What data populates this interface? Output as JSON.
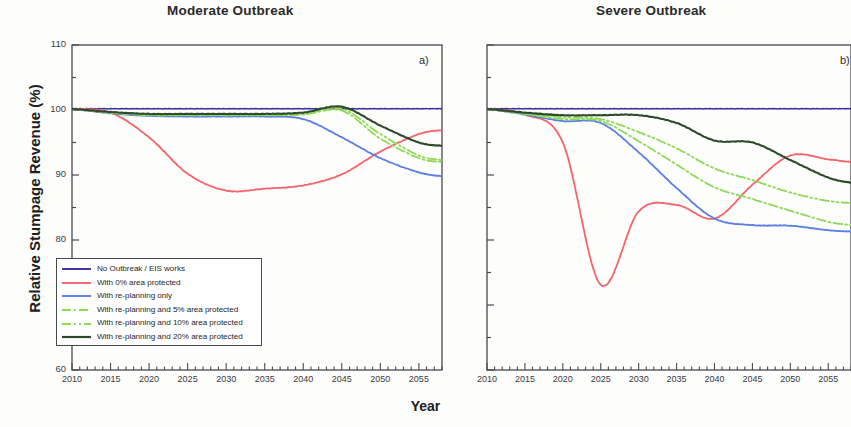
{
  "figure": {
    "ylabel": "Relative Stumpage Revenue (%)",
    "xlabel": "Year",
    "panel_a_letter": "a)",
    "panel_b_letter": "b)"
  },
  "panels": [
    {
      "key": "moderate",
      "title": "Moderate Outbreak"
    },
    {
      "key": "severe",
      "title": "Severe Outbreak"
    }
  ],
  "axis": {
    "ytick_labels": [
      "110",
      "100",
      "90",
      "80",
      "70",
      "60"
    ],
    "xtick_labels": [
      "2010",
      "2015",
      "2020",
      "2025",
      "2030",
      "2035",
      "2040",
      "2045",
      "2050",
      "2055"
    ]
  },
  "legend": {
    "entries": [
      {
        "label": "No Outbreak / EIS works",
        "color": "#3b2fa0",
        "style": "solid"
      },
      {
        "label": "With 0% area protected",
        "color": "#f4646a",
        "style": "solid"
      },
      {
        "label": "With re-planning only",
        "color": "#5a7fe0",
        "style": "solid"
      },
      {
        "label": "With re-planning and 5% area protected",
        "color": "#8ed957",
        "style": "dashdot"
      },
      {
        "label": "With re-planning and 10% area protected",
        "color": "#8ed957",
        "style": "dashdotdot"
      },
      {
        "label": "With re-planning and 20% area protected",
        "color": "#2d4a2a",
        "style": "solid"
      }
    ]
  },
  "chart_data": {
    "type": "line",
    "xlabel": "Year",
    "ylabel": "Relative Stumpage Revenue (%)",
    "xlim": [
      2010,
      2058
    ],
    "ylim": [
      60,
      110
    ],
    "yticks": [
      60,
      70,
      80,
      90,
      100,
      110
    ],
    "xticks": [
      2010,
      2015,
      2020,
      2025,
      2030,
      2035,
      2040,
      2045,
      2050,
      2055
    ],
    "grid": false,
    "legend_position": "lower-left of panel a",
    "panels": [
      {
        "label": "a)",
        "title": "Moderate Outbreak",
        "x": [
          2010,
          2015,
          2020,
          2025,
          2030,
          2035,
          2040,
          2045,
          2050,
          2055,
          2058
        ],
        "series": [
          {
            "name": "No Outbreak / EIS works",
            "color": "#3b2fa0",
            "style": "solid",
            "values": [
              100.2,
              100.2,
              100.2,
              100.2,
              100.2,
              100.2,
              100.2,
              100.2,
              100.2,
              100.2,
              100.2
            ]
          },
          {
            "name": "With 0% area protected",
            "color": "#f4646a",
            "style": "solid",
            "values": [
              100.2,
              99.6,
              95.8,
              90.2,
              87.6,
              87.9,
              88.4,
              90.1,
              93.6,
              96.3,
              96.9
            ]
          },
          {
            "name": "With re-planning only",
            "color": "#5a7fe0",
            "style": "solid",
            "values": [
              100.2,
              99.5,
              99.1,
              99.0,
              99.0,
              99.0,
              98.6,
              95.8,
              92.6,
              90.4,
              89.8
            ]
          },
          {
            "name": "With re-planning and 5% area protected",
            "color": "#8ed957",
            "style": "dashdot",
            "values": [
              100.2,
              99.6,
              99.2,
              99.2,
              99.2,
              99.2,
              99.3,
              99.9,
              95.6,
              92.6,
              92.0
            ]
          },
          {
            "name": "With re-planning and 10% area protected",
            "color": "#8ed957",
            "style": "dashdotdot",
            "values": [
              100.2,
              99.6,
              99.3,
              99.3,
              99.3,
              99.3,
              99.4,
              100.2,
              96.3,
              93.0,
              92.3
            ]
          },
          {
            "name": "With re-planning and 20% area protected",
            "color": "#2d4a2a",
            "style": "solid",
            "values": [
              100.2,
              99.7,
              99.4,
              99.4,
              99.4,
              99.4,
              99.6,
              100.5,
              97.6,
              95.0,
              94.5
            ]
          }
        ]
      },
      {
        "label": "b)",
        "title": "Severe Outbreak",
        "x": [
          2010,
          2015,
          2020,
          2025,
          2030,
          2035,
          2040,
          2045,
          2050,
          2055,
          2058
        ],
        "values_note": "Right panel is clipped at the right edge of the screenshot",
        "series": [
          {
            "name": "No Outbreak / EIS works",
            "color": "#3b2fa0",
            "style": "solid",
            "values": [
              100.2,
              100.2,
              100.2,
              100.2,
              100.2,
              100.2,
              100.2,
              100.2,
              100.2,
              100.2,
              100.2
            ]
          },
          {
            "name": "With 0% area protected",
            "color": "#f4646a",
            "style": "solid",
            "values": [
              100.2,
              99.3,
              95.0,
              73.1,
              84.4,
              85.4,
              83.3,
              88.5,
              93.0,
              92.4,
              92.0
            ]
          },
          {
            "name": "With re-planning only",
            "color": "#5a7fe0",
            "style": "solid",
            "values": [
              100.2,
              99.3,
              98.3,
              98.0,
              93.5,
              88.0,
              83.3,
              82.3,
              82.2,
              81.5,
              81.3
            ]
          },
          {
            "name": "With re-planning and 5% area protected",
            "color": "#8ed957",
            "style": "dashdot",
            "values": [
              100.2,
              99.4,
              98.6,
              98.3,
              95.2,
              91.6,
              88.1,
              86.3,
              84.5,
              82.8,
              82.3
            ]
          },
          {
            "name": "With re-planning and 10% area protected",
            "color": "#8ed957",
            "style": "dashdotdot",
            "values": [
              100.2,
              99.5,
              98.9,
              98.6,
              96.6,
              94.1,
              91.0,
              89.2,
              87.3,
              86.0,
              85.7
            ]
          },
          {
            "name": "With re-planning and 20% area protected",
            "color": "#2d4a2a",
            "style": "solid",
            "values": [
              100.2,
              99.6,
              99.2,
              99.2,
              99.2,
              98.0,
              95.3,
              95.0,
              92.3,
              89.6,
              88.8
            ]
          }
        ]
      }
    ]
  }
}
